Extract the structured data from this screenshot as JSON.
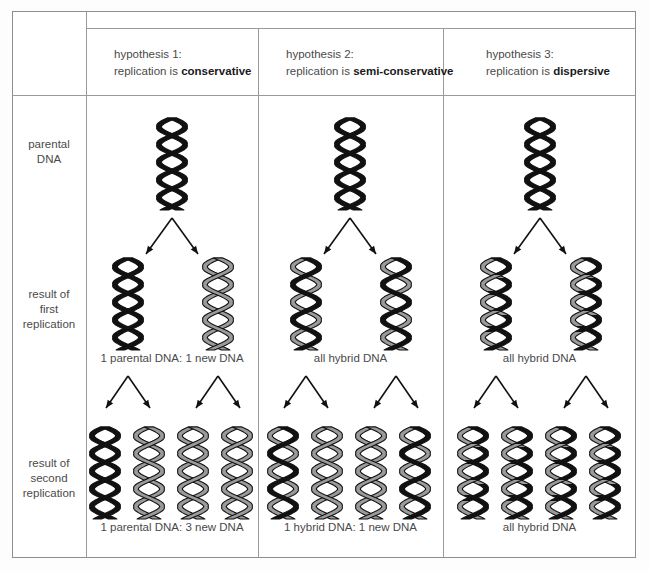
{
  "figure": {
    "colors": {
      "parental_strand": "#111111",
      "new_strand": "#9a9a9a",
      "outline": "#111111",
      "border": "#8d8d8d",
      "text": "#4a4a4a",
      "background": "#ffffff"
    }
  },
  "columns": [
    {
      "id": "hypothesis-1",
      "line1": "hypothesis 1:",
      "line2_prefix": "replication is ",
      "line2_bold": "conservative",
      "first_result_caption": "1 parental DNA: 1 new DNA",
      "second_result_caption": "1 parental DNA: 3 new DNA",
      "row1_helices": [
        "parental"
      ],
      "row2_helices": [
        "parental",
        "new"
      ],
      "row3_helices": [
        "parental",
        "new",
        "new",
        "new"
      ]
    },
    {
      "id": "hypothesis-2",
      "line1": "hypothesis 2:",
      "line2_prefix": "replication is ",
      "line2_bold": "semi-conservative",
      "first_result_caption": "all hybrid DNA",
      "second_result_caption": "1 hybrid DNA: 1 new DNA",
      "row1_helices": [
        "parental"
      ],
      "row2_helices": [
        "hybrid",
        "hybrid"
      ],
      "row3_helices": [
        "hybrid",
        "new",
        "new",
        "hybrid"
      ]
    },
    {
      "id": "hypothesis-3",
      "line1": "hypothesis 3:",
      "line2_prefix": "replication is ",
      "line2_bold": "dispersive",
      "first_result_caption": "all hybrid DNA",
      "second_result_caption": "all hybrid DNA",
      "row1_helices": [
        "parental"
      ],
      "row2_helices": [
        "dispersive",
        "dispersive"
      ],
      "row3_helices": [
        "dispersive",
        "dispersive",
        "dispersive",
        "dispersive"
      ]
    }
  ],
  "rows": [
    {
      "id": "parental-dna",
      "label": "parental\nDNA",
      "label_line1": "parental",
      "label_line2": "DNA"
    },
    {
      "id": "first-replication",
      "label_line1": "result of",
      "label_line2": "first",
      "label_line3": "replication"
    },
    {
      "id": "second-replication",
      "label_line1": "result of",
      "label_line2": "second",
      "label_line3": "replication"
    }
  ],
  "labels": {
    "row1_l1": "parental",
    "row1_l2": "DNA",
    "row2_l1": "result of",
    "row2_l2": "first",
    "row2_l3": "replication",
    "row3_l1": "result of",
    "row3_l2": "second",
    "row3_l3": "replication"
  }
}
